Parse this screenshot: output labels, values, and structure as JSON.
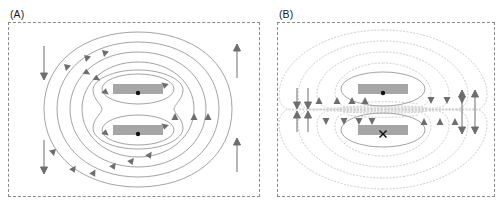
{
  "figure": {
    "width": 499,
    "height": 205,
    "background": "#ffffff",
    "type": "scientific-figure"
  },
  "style": {
    "border_color": "#8a8a8a",
    "contour_solid_color": "#999999",
    "contour_dotted_color": "#cccccc",
    "magnet_fill": "#a6a6a6",
    "arrow_color": "#6e6e6e",
    "marker_color": "#111111",
    "label_color": "#1a1a1a"
  },
  "panels": [
    {
      "id": "panel-a",
      "label": "(A)",
      "label_x": 10,
      "label_y": 9,
      "frame": {
        "x": 8,
        "y": 22,
        "width": 252,
        "height": 175
      },
      "contour_style": "solid",
      "magnets": [
        {
          "id": "magnet-a-top",
          "x": 113,
          "y": 84,
          "width": 50,
          "height": 10,
          "symbol": "dot",
          "symbol_name": "current-out-of-page"
        },
        {
          "id": "magnet-a-bottom",
          "x": 113,
          "y": 125,
          "width": 50,
          "height": 10,
          "symbol": "dot",
          "symbol_name": "current-out-of-page"
        }
      ],
      "straight_arrows": [
        {
          "id": "arrow-a-left-top",
          "x": 44,
          "y1": 46,
          "y2": 78,
          "direction": "down"
        },
        {
          "id": "arrow-a-left-bottom",
          "x": 44,
          "y1": 140,
          "y2": 172,
          "direction": "down"
        },
        {
          "id": "arrow-a-right-top",
          "x": 237,
          "y1": 78,
          "y2": 46,
          "direction": "up"
        },
        {
          "id": "arrow-a-right-bottom",
          "x": 237,
          "y1": 172,
          "y2": 140,
          "direction": "up"
        }
      ]
    },
    {
      "id": "panel-b",
      "label": "(B)",
      "label_x": 279,
      "label_y": 9,
      "frame": {
        "x": 277,
        "y": 22,
        "width": 218,
        "height": 175
      },
      "contour_style": "dotted",
      "magnets": [
        {
          "id": "magnet-b-top",
          "x": 358,
          "y": 84,
          "width": 50,
          "height": 10,
          "symbol": "dot",
          "symbol_name": "current-out-of-page"
        },
        {
          "id": "magnet-b-bottom",
          "x": 358,
          "y": 125,
          "width": 50,
          "height": 10,
          "symbol": "cross",
          "symbol_name": "current-into-page"
        }
      ],
      "straight_arrows": [
        {
          "id": "arrow-b-left-outer-down",
          "x": 297,
          "y1": 90,
          "y2": 110,
          "direction": "down"
        },
        {
          "id": "arrow-b-left-inner-down",
          "x": 307,
          "y1": 90,
          "y2": 110,
          "direction": "down"
        },
        {
          "id": "arrow-b-left-outer-up",
          "x": 297,
          "y1": 130,
          "y2": 112,
          "direction": "up"
        },
        {
          "id": "arrow-b-left-inner-up",
          "x": 307,
          "y1": 130,
          "y2": 112,
          "direction": "up"
        },
        {
          "id": "arrow-b-right-inner-up",
          "x": 462,
          "y1": 128,
          "y2": 90,
          "direction": "up"
        },
        {
          "id": "arrow-b-right-outer-up",
          "x": 474,
          "y1": 90,
          "y2": 128,
          "direction": "down"
        }
      ]
    }
  ],
  "chart_data": {
    "type": "contour",
    "title": "",
    "panels": [
      {
        "name": "(A)",
        "configuration": "parallel currents",
        "current_directions": [
          "out-of-page",
          "out-of-page"
        ],
        "field_topology": "nested closed contours encircling both conductors",
        "contour_count": 5,
        "line_style": "solid",
        "field_direction_left": "downward",
        "field_direction_right": "upward"
      },
      {
        "name": "(B)",
        "configuration": "antiparallel currents",
        "current_directions": [
          "out-of-page",
          "into-page"
        ],
        "field_topology": "separate lobes around each conductor with X-point between",
        "contour_count": 5,
        "line_style": "dotted",
        "field_direction_left": "bidirectional (down outer, up inner)",
        "field_direction_right": "bidirectional (up inner, down outer)"
      }
    ]
  }
}
